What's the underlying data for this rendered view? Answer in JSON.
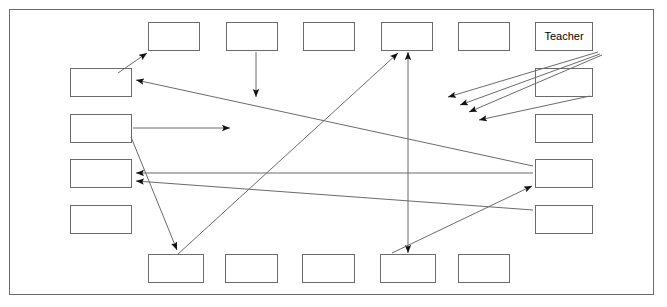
{
  "diagram": {
    "frame": {
      "name": "classroom-boundary",
      "x": 9,
      "y": 9,
      "width": 645,
      "height": 286
    },
    "canvas": {
      "width": 667,
      "height": 307
    },
    "colors": {
      "stroke": "#6b6b6b",
      "background": "#ffffff",
      "text": "#000000"
    },
    "desks": [
      {
        "id": "top-1",
        "label": "",
        "x": 148,
        "y": 22,
        "w": 52,
        "h": 29
      },
      {
        "id": "top-2",
        "label": "",
        "x": 226,
        "y": 22,
        "w": 52,
        "h": 29
      },
      {
        "id": "top-3",
        "label": "",
        "x": 303,
        "y": 22,
        "w": 52,
        "h": 29
      },
      {
        "id": "top-4",
        "label": "",
        "x": 381,
        "y": 22,
        "w": 52,
        "h": 29
      },
      {
        "id": "top-5",
        "label": "",
        "x": 458,
        "y": 22,
        "w": 52,
        "h": 29
      },
      {
        "id": "teacher",
        "label": "Teacher",
        "x": 535,
        "y": 22,
        "w": 58,
        "h": 29
      },
      {
        "id": "left-1",
        "label": "",
        "x": 70,
        "y": 68,
        "w": 62,
        "h": 29
      },
      {
        "id": "left-2",
        "label": "",
        "x": 70,
        "y": 114,
        "w": 62,
        "h": 29
      },
      {
        "id": "left-3",
        "label": "",
        "x": 70,
        "y": 159,
        "w": 62,
        "h": 29
      },
      {
        "id": "left-4",
        "label": "",
        "x": 70,
        "y": 205,
        "w": 62,
        "h": 29
      },
      {
        "id": "right-1",
        "label": "",
        "x": 535,
        "y": 68,
        "w": 58,
        "h": 29
      },
      {
        "id": "right-2",
        "label": "",
        "x": 535,
        "y": 114,
        "w": 58,
        "h": 29
      },
      {
        "id": "right-3",
        "label": "",
        "x": 535,
        "y": 159,
        "w": 58,
        "h": 29
      },
      {
        "id": "right-4",
        "label": "",
        "x": 535,
        "y": 205,
        "w": 58,
        "h": 29
      },
      {
        "id": "bottom-1",
        "label": "",
        "x": 148,
        "y": 254,
        "w": 56,
        "h": 29
      },
      {
        "id": "bottom-2",
        "label": "",
        "x": 225,
        "y": 254,
        "w": 53,
        "h": 29
      },
      {
        "id": "bottom-3",
        "label": "",
        "x": 302,
        "y": 254,
        "w": 53,
        "h": 29
      },
      {
        "id": "bottom-4",
        "label": "",
        "x": 380,
        "y": 254,
        "w": 56,
        "h": 29
      },
      {
        "id": "bottom-5",
        "label": "",
        "x": 458,
        "y": 254,
        "w": 52,
        "h": 29
      }
    ],
    "arrows": [
      {
        "id": "a1",
        "from": "left-1",
        "to": "top-1",
        "x1": 118,
        "y1": 73,
        "x2": 147,
        "y2": 53,
        "heads": "end"
      },
      {
        "id": "a2",
        "from": "right-3",
        "to": "left-1",
        "x1": 533,
        "y1": 166,
        "x2": 136,
        "y2": 80,
        "heads": "end"
      },
      {
        "id": "a3",
        "from": "top-2",
        "to": "field",
        "x1": 256,
        "y1": 52,
        "x2": 256,
        "y2": 97,
        "heads": "end"
      },
      {
        "id": "a4",
        "from": "left-2",
        "to": "field",
        "x1": 133,
        "y1": 128,
        "x2": 230,
        "y2": 128,
        "heads": "end"
      },
      {
        "id": "a5",
        "from": "left-2",
        "to": "bottom-1",
        "x1": 131,
        "y1": 137,
        "x2": 177,
        "y2": 250,
        "heads": "end"
      },
      {
        "id": "a6",
        "from": "right-3",
        "to": "left-3",
        "x1": 533,
        "y1": 173,
        "x2": 136,
        "y2": 173,
        "heads": "end"
      },
      {
        "id": "a7",
        "from": "right-4",
        "to": "left-3",
        "x1": 533,
        "y1": 210,
        "x2": 136,
        "y2": 181,
        "heads": "end"
      },
      {
        "id": "a8",
        "from": "bottom-1",
        "to": "top-4",
        "x1": 178,
        "y1": 254,
        "x2": 398,
        "y2": 53,
        "heads": "end"
      },
      {
        "id": "a9",
        "from": "top-4",
        "to": "bottom-4",
        "x1": 408,
        "y1": 52,
        "x2": 408,
        "y2": 253,
        "heads": "both"
      },
      {
        "id": "a10",
        "from": "bottom-4",
        "to": "right-3",
        "x1": 392,
        "y1": 253,
        "x2": 532,
        "y2": 186,
        "heads": "end"
      },
      {
        "id": "a11",
        "from": "teacher",
        "to": "student-a",
        "x1": 598,
        "y1": 52,
        "x2": 448,
        "y2": 97,
        "heads": "end"
      },
      {
        "id": "a12",
        "from": "teacher",
        "to": "student-b",
        "x1": 600,
        "y1": 54,
        "x2": 460,
        "y2": 105,
        "heads": "end"
      },
      {
        "id": "a13",
        "from": "teacher",
        "to": "student-c",
        "x1": 602,
        "y1": 55,
        "x2": 469,
        "y2": 112,
        "heads": "end"
      },
      {
        "id": "a14",
        "from": "right-2",
        "to": "student-d",
        "x1": 590,
        "y1": 96,
        "x2": 479,
        "y2": 120,
        "heads": "end"
      }
    ]
  }
}
